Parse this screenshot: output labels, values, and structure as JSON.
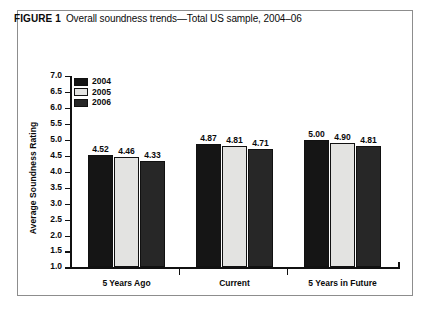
{
  "figure": {
    "label": "FIGURE 1",
    "caption": "Overall soundness trends—Total US sample, 2004–06"
  },
  "chart_data": {
    "type": "bar",
    "title": "Overall soundness trends—Total US sample, 2004–06",
    "xlabel": "",
    "ylabel": "Average Soundness Rating",
    "ylim": [
      1.0,
      7.0
    ],
    "ytick_step": 0.5,
    "yticks": [
      "7.0",
      "6.5",
      "6.0",
      "5.5",
      "5.0",
      "4.5",
      "4.0",
      "3.5",
      "3.0",
      "2.5",
      "2.0",
      "1.5",
      "1.0"
    ],
    "grid": false,
    "legend_position": "top-left",
    "categories": [
      "5 Years Ago",
      "Current",
      "5 Years in Future"
    ],
    "series": [
      {
        "name": "2004",
        "color": "#151515",
        "values": [
          4.52,
          4.87,
          5.0
        ],
        "labels": [
          "4.52",
          "4.87",
          "5.00"
        ]
      },
      {
        "name": "2005",
        "color": "#e3e3e1",
        "values": [
          4.46,
          4.81,
          4.9
        ],
        "labels": [
          "4.46",
          "4.81",
          "4.90"
        ]
      },
      {
        "name": "2006",
        "color": "#272727",
        "values": [
          4.33,
          4.71,
          4.81
        ],
        "labels": [
          "4.33",
          "4.71",
          "4.81"
        ]
      }
    ]
  }
}
